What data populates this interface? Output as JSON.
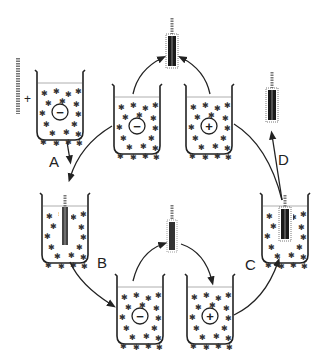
{
  "diagram": {
    "type": "layer-by-layer deposition cycle",
    "colors": {
      "ink": "#222222",
      "rod_dark": "#1a1a1a",
      "rod_light": "#8a8a8a",
      "background": "#ffffff"
    },
    "steps": [
      {
        "id": "A",
        "label": "A"
      },
      {
        "id": "B",
        "label": "B"
      },
      {
        "id": "C",
        "label": "C"
      },
      {
        "id": "D",
        "label": "D"
      }
    ],
    "plus_symbol": "+",
    "beakers": [
      {
        "name": "start-beaker",
        "charge": "−"
      },
      {
        "name": "top-left-beaker",
        "charge": "−"
      },
      {
        "name": "top-right-beaker",
        "charge": "+"
      },
      {
        "name": "left-beaker-with-rod",
        "charge": ""
      },
      {
        "name": "bottom-left-beaker",
        "charge": "−"
      },
      {
        "name": "bottom-right-beaker",
        "charge": "+"
      },
      {
        "name": "right-beaker-with-rod",
        "charge": ""
      }
    ]
  }
}
